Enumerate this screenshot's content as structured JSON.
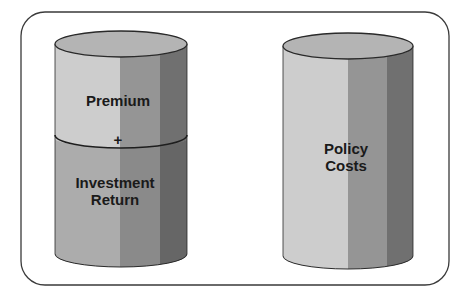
{
  "diagram": {
    "frame": {
      "shape": "rounded-rectangle"
    },
    "cylinders": [
      {
        "id": "left",
        "segments": [
          {
            "label_lines": [
              "Premium"
            ]
          },
          {
            "label_lines": [
              "Investment",
              "Return"
            ]
          }
        ],
        "operator": "+"
      },
      {
        "id": "right",
        "segments": [
          {
            "label_lines": [
              "Policy",
              "Costs"
            ]
          }
        ]
      }
    ],
    "colors": {
      "frame_stroke": "#3a3a3a",
      "top_ellipse": "#b4b4b4",
      "upper_light": "#cdcdcd",
      "upper_mid": "#959595",
      "upper_dark": "#707070",
      "lower_light": "#acacac",
      "lower_mid": "#8a8a8a",
      "lower_dark": "#666666",
      "outline": "#2a2a2a"
    }
  }
}
